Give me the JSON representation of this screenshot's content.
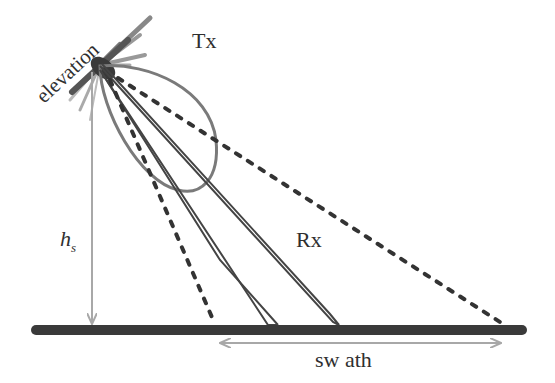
{
  "diagram": {
    "labels": {
      "elevation": "elevation",
      "tx": "Tx",
      "rx": "Rx",
      "height_main": "h",
      "height_sub": "s",
      "swath": "sw ath"
    },
    "colors": {
      "ground": "#3a3a3a",
      "tx_beam": "#7a7a7a",
      "rx_beam": "#444444",
      "dashed": "#333333",
      "arrows": "#a8a8a8",
      "antenna": "#555555"
    }
  }
}
